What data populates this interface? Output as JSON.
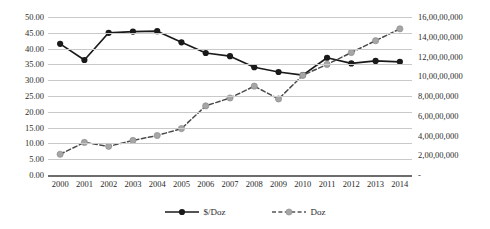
{
  "chart_data": {
    "type": "line",
    "title": "",
    "xlabel": "",
    "ylabel": "",
    "grid": true,
    "legend_position": "bottom",
    "categories": [
      "2000",
      "2001",
      "2002",
      "2003",
      "2004",
      "2005",
      "2006",
      "2007",
      "2008",
      "2009",
      "2010",
      "2011",
      "2012",
      "2013",
      "2014"
    ],
    "axes": {
      "left": {
        "label": "",
        "ylim": [
          0,
          50
        ],
        "tick_step": 5,
        "ticks": [
          "50.00",
          "45.00",
          "40.00",
          "35.00",
          "30.00",
          "25.00",
          "20.00",
          "15.00",
          "10.00",
          "5.00",
          "0.00"
        ],
        "tick_values": [
          50,
          45,
          40,
          35,
          30,
          25,
          20,
          15,
          10,
          5,
          0
        ]
      },
      "right": {
        "label": "",
        "ylim": [
          0,
          160000000
        ],
        "tick_step": 20000000,
        "ticks": [
          "16,00,00,000",
          "14,00,00,000",
          "12,00,00,000",
          "10,00,00,000",
          "8,00,00,000",
          "6,00,00,000",
          "4,00,00,000",
          "2,00,00,000",
          "-"
        ],
        "tick_values": [
          160000000,
          140000000,
          120000000,
          100000000,
          80000000,
          60000000,
          40000000,
          20000000,
          0
        ]
      }
    },
    "series": [
      {
        "name": "$/Doz",
        "axis": "left",
        "color": "#1a1a1a",
        "line_style": "solid",
        "marker": "circle-filled",
        "values": [
          41.5,
          36.4,
          45.0,
          45.4,
          45.5,
          42.0,
          38.6,
          37.6,
          34.1,
          32.6,
          31.6,
          37.1,
          35.3,
          36.1,
          35.8
        ]
      },
      {
        "name": "Doz",
        "axis": "right",
        "color": "#a6a6a6",
        "line_style": "dashed",
        "marker": "circle-filled",
        "values": [
          21000000,
          33000000,
          29000000,
          35000000,
          40000000,
          47000000,
          70000000,
          78000000,
          90000000,
          77000000,
          101000000,
          112000000,
          124000000,
          136000000,
          148000000
        ]
      }
    ]
  },
  "legend": {
    "items": [
      {
        "label": "$/Doz"
      },
      {
        "label": "Doz"
      }
    ]
  }
}
